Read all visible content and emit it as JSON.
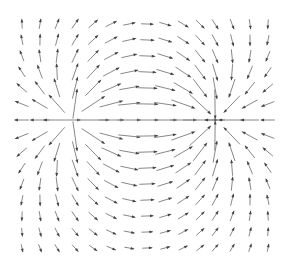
{
  "chart_data": {
    "type": "quiver",
    "title": "",
    "xlabel": "",
    "ylabel": "",
    "grid": false,
    "axes_visible": false,
    "grid_shape": {
      "cols": 15,
      "rows": 15
    },
    "x_pixels": [
      22,
      40,
      57,
      75,
      93,
      111,
      129,
      147,
      165,
      183,
      200,
      215,
      232,
      250,
      268
    ],
    "y_pixels": [
      24,
      40,
      56,
      72,
      88,
      104,
      120,
      136,
      152,
      168,
      184,
      200,
      216,
      232,
      248
    ],
    "source": {
      "label": "source",
      "x_px": 75,
      "y_px": 120,
      "strength": 1
    },
    "sink": {
      "label": "sink",
      "x_px": 213,
      "y_px": 120,
      "strength": -1
    },
    "arrow_color": "#444444",
    "line_color": "#888888",
    "max_arrow_length_px": 34,
    "min_arrow_length_px": 3
  }
}
